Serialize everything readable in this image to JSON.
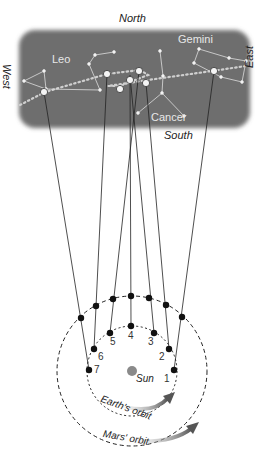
{
  "directions": {
    "north": "North",
    "south": "South",
    "east": "East",
    "west": "West"
  },
  "constellations": {
    "leo": "Leo",
    "gemini": "Gemini",
    "cancer": "Cancer"
  },
  "labels": {
    "sun": "Sun",
    "earth_orbit": "Earth's orbit",
    "mars_orbit": "Mars' orbit"
  },
  "earth_positions": [
    "1",
    "2",
    "3",
    "4",
    "5",
    "6",
    "7"
  ],
  "mars_sky_positions": [
    "1",
    "2",
    "3",
    "4",
    "5",
    "6",
    "7"
  ],
  "colors": {
    "sky_panel": "#6e6e6e",
    "sun": "#8a8a8a",
    "planet_dot": "#111111",
    "ecliptic": "#c8c8c8"
  }
}
